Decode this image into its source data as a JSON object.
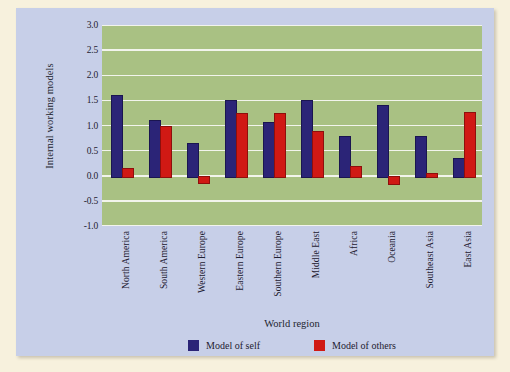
{
  "chart_data": {
    "type": "bar",
    "title": "",
    "xlabel": "World region",
    "ylabel": "Internal working models",
    "ylim": [
      -1.0,
      3.0
    ],
    "yticks": [
      "3.0",
      "2.5",
      "2.0",
      "1.5",
      "1.0",
      "0.5",
      "0.0",
      "-0.5",
      "-1.0"
    ],
    "ytick_values": [
      3.0,
      2.5,
      2.0,
      1.5,
      1.0,
      0.5,
      0.0,
      -0.5,
      -1.0
    ],
    "grid": true,
    "legend_position": "bottom",
    "categories": [
      "North America",
      "South America",
      "Western Europe",
      "Eastern Europe",
      "Southern Europe",
      "Middle East",
      "Africa",
      "Oceania",
      "Southeast Asia",
      "East Asia"
    ],
    "series": [
      {
        "name": "Model of self",
        "color": "#2b2477",
        "values": [
          1.6,
          1.1,
          0.65,
          1.5,
          1.07,
          1.5,
          0.8,
          1.4,
          0.8,
          0.35
        ]
      },
      {
        "name": "Model of others",
        "color": "#d01914",
        "values": [
          0.15,
          1.0,
          -0.12,
          1.25,
          1.25,
          0.9,
          0.2,
          -0.15,
          0.05,
          1.27
        ]
      }
    ],
    "plot_background": "#a9c183",
    "panel_background": "#c7cfe8",
    "page_background": "#f7f1dd",
    "gridline_color": "#f2f4ec"
  }
}
